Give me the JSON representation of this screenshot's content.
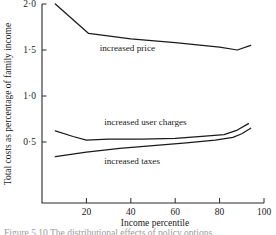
{
  "chart_data": {
    "type": "line",
    "title": "",
    "xlabel": "Income percentile",
    "ylabel": "Total costs as percentage of family income",
    "xlim": [
      0,
      100
    ],
    "ylim": [
      0.0,
      2.0
    ],
    "xticks": [
      20,
      40,
      60,
      80,
      100
    ],
    "xtick_labels": [
      "20",
      "40",
      "60",
      "80",
      "100"
    ],
    "yticks": [
      0.5,
      1.0,
      1.5,
      2.0
    ],
    "ytick_labels": [
      "0·5",
      "1·0",
      "1·5",
      "2·0"
    ],
    "grid": false,
    "legend": "inline-annotations",
    "series": [
      {
        "name": "increased price",
        "label": "increased price",
        "label_x": 26,
        "label_y": 1.52,
        "x": [
          6,
          21,
          40,
          60,
          80,
          88,
          94
        ],
        "values": [
          2.0,
          1.68,
          1.62,
          1.58,
          1.53,
          1.5,
          1.55
        ]
      },
      {
        "name": "increased user charges",
        "label": "increased user charges",
        "label_x": 28,
        "label_y": 0.72,
        "x": [
          6,
          14,
          20,
          30,
          45,
          60,
          72,
          82,
          88,
          93
        ],
        "values": [
          0.62,
          0.56,
          0.52,
          0.53,
          0.53,
          0.54,
          0.56,
          0.58,
          0.63,
          0.7
        ]
      },
      {
        "name": "increased taxes",
        "label": "increased taxes",
        "label_x": 28,
        "label_y": 0.3,
        "x": [
          6,
          20,
          35,
          50,
          65,
          78,
          86,
          90,
          94
        ],
        "values": [
          0.34,
          0.39,
          0.43,
          0.46,
          0.49,
          0.52,
          0.55,
          0.59,
          0.65
        ]
      }
    ]
  },
  "caption": {
    "text": "Figure 5.10  The distributional effects of policy options"
  },
  "colors": {
    "line": "#1a1a1a",
    "axis": "#2b2b2b",
    "background": "#ffffff",
    "caption": "#9a9a9a"
  }
}
